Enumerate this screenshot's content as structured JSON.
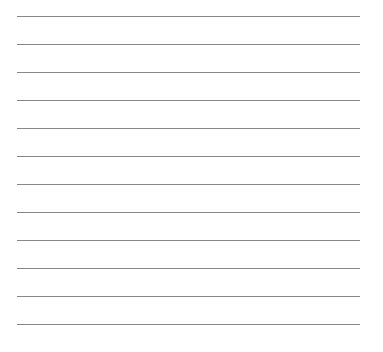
{
  "sheet": {
    "line_count": 12,
    "line_color": "#7a7a7a",
    "background": "#ffffff",
    "line_positions_y": [
      16,
      44,
      72,
      100,
      128,
      156,
      184,
      212,
      240,
      268,
      296,
      324
    ]
  }
}
